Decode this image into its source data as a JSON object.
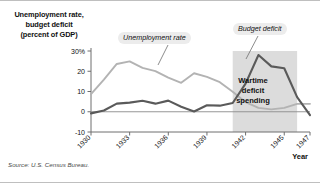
{
  "figure": {
    "yaxis_title_lines": [
      "Unemployment rate,",
      "budget deficit",
      "(percent of GDP)"
    ],
    "xaxis_name": "Year",
    "source": "Source: U.S. Census Bureau.",
    "callout_unemployment": "Unemployment rate",
    "callout_deficit": "Budget deficit",
    "wartime_label_lines": [
      "Wartime",
      "deficit",
      "spending"
    ],
    "colors": {
      "unemployment_line": "#b3b3b3",
      "deficit_line": "#5a5a5a",
      "shaded_band": "#dcdcdc",
      "callout_bg": "#ececec",
      "axis": "#6e6e6e",
      "frame": "#bfbfbf"
    }
  },
  "chart_data": {
    "type": "line",
    "title": "Unemployment rate, budget deficit (percent of GDP)",
    "xlabel": "Year",
    "ylabel": "Unemployment rate, budget deficit (percent of GDP)",
    "xlim": [
      1930,
      1947
    ],
    "ylim": [
      -10,
      30
    ],
    "xticks": [
      1930,
      1933,
      1936,
      1939,
      1942,
      1945,
      1947
    ],
    "xticklabels": [
      "1930",
      "1933",
      "1936",
      "1939",
      "1942",
      "1945",
      "1947"
    ],
    "yticks": [
      -10,
      0,
      10,
      20,
      30
    ],
    "yticklabels": [
      "-10",
      "0",
      "10",
      "20",
      "30%"
    ],
    "grid": false,
    "legend": "annotations",
    "zero_line": true,
    "shaded_region": {
      "label": "Wartime deficit spending",
      "x_start": 1941,
      "x_end": 1946
    },
    "x": [
      1930,
      1931,
      1932,
      1933,
      1934,
      1935,
      1936,
      1937,
      1938,
      1939,
      1940,
      1941,
      1942,
      1943,
      1944,
      1945,
      1946,
      1947
    ],
    "series": [
      {
        "name": "Unemployment rate",
        "color": "#b3b3b3",
        "values": [
          8.7,
          15.9,
          23.6,
          24.9,
          21.7,
          20.1,
          16.9,
          14.3,
          19.0,
          17.2,
          14.6,
          9.9,
          4.7,
          1.9,
          1.2,
          1.9,
          3.9,
          3.9
        ]
      },
      {
        "name": "Budget deficit",
        "color": "#5a5a5a",
        "values": [
          -0.8,
          0.6,
          4.0,
          4.5,
          5.4,
          4.0,
          5.5,
          2.5,
          0.1,
          3.2,
          3.0,
          4.3,
          13.9,
          28.0,
          22.4,
          21.5,
          7.2,
          -1.7
        ]
      }
    ]
  }
}
